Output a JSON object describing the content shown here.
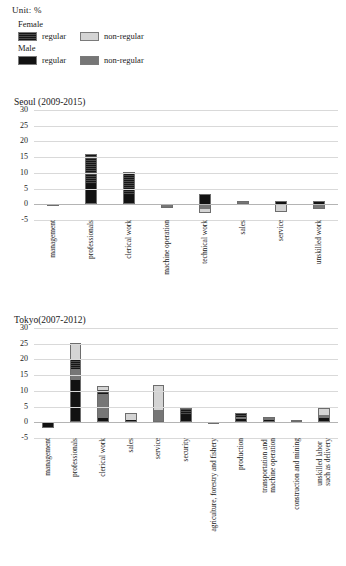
{
  "unit_note": "Unit: %",
  "legend": {
    "groups": [
      {
        "title": "Female",
        "items": [
          {
            "label": "regular",
            "swatch": "female-regular",
            "color": "#2e2e2e"
          },
          {
            "label": "non-regular",
            "swatch": "female-non-regular",
            "color": "#d4d4d4"
          }
        ]
      },
      {
        "title": "Male",
        "items": [
          {
            "label": "regular",
            "swatch": "male-regular",
            "color": "#121212"
          },
          {
            "label": "non-regular",
            "swatch": "male-non-regular",
            "color": "#767676"
          }
        ]
      }
    ]
  },
  "chart_data": [
    {
      "type": "bar",
      "stacked": true,
      "title": "Seoul (2009-2015)",
      "xlabel": "",
      "ylabel": "",
      "ylim": [
        -5,
        30
      ],
      "yticks": [
        30,
        25,
        20,
        15,
        10,
        5,
        0,
        -5
      ],
      "ytick_labels": [
        "30",
        "25",
        "20",
        "15",
        "10",
        "5",
        "0",
        "-5"
      ],
      "grid": true,
      "legend_position": "top-left",
      "categories": [
        "management",
        "professionals",
        "clerical work",
        "machine operation",
        "technical work",
        "sales",
        "service",
        "unskilled work"
      ],
      "series": [
        {
          "name": "Male regular",
          "color": "#121212",
          "values": [
            -0.5,
            6.4,
            3.0,
            0.0,
            3.4,
            0.0,
            1.2,
            0.9
          ]
        },
        {
          "name": "Male non-regular",
          "color": "#767676",
          "values": [
            0.0,
            0.0,
            0.0,
            -0.8,
            -1.6,
            0.8,
            0.0,
            -1.5
          ]
        },
        {
          "name": "Female regular",
          "color": "#2e2e2e",
          "values": [
            0.0,
            9.5,
            7.3,
            0.0,
            0.0,
            0.0,
            0.0,
            0.0
          ]
        },
        {
          "name": "Female non-regular",
          "color": "#d4d4d4",
          "values": [
            0.0,
            0.0,
            0.0,
            -0.4,
            -1.2,
            0.4,
            -2.6,
            0.0
          ]
        }
      ],
      "bar_stacks": [
        {
          "category": "management",
          "segments": [
            {
              "series": "Male regular",
              "from": -0.5,
              "to": 0.0
            }
          ]
        },
        {
          "category": "professionals",
          "segments": [
            {
              "series": "Male regular",
              "from": 0.0,
              "to": 6.4
            },
            {
              "series": "Female regular",
              "from": 6.4,
              "to": 15.9
            }
          ]
        },
        {
          "category": "clerical work",
          "segments": [
            {
              "series": "Male regular",
              "from": 0.0,
              "to": 3.0
            },
            {
              "series": "Female regular",
              "from": 3.0,
              "to": 10.3
            }
          ]
        },
        {
          "category": "machine operation",
          "segments": [
            {
              "series": "Male non-regular",
              "from": -0.8,
              "to": 0.0
            },
            {
              "series": "Female non-regular",
              "from": -1.2,
              "to": -0.8
            }
          ]
        },
        {
          "category": "technical work",
          "segments": [
            {
              "series": "Male regular",
              "from": 0.0,
              "to": 3.4
            },
            {
              "series": "Male non-regular",
              "from": -1.6,
              "to": 0.0
            },
            {
              "series": "Female non-regular",
              "from": -2.8,
              "to": -1.6
            }
          ]
        },
        {
          "category": "sales",
          "segments": [
            {
              "series": "Female non-regular",
              "from": 0.0,
              "to": 0.4
            },
            {
              "series": "Male non-regular",
              "from": 0.4,
              "to": 1.2
            }
          ]
        },
        {
          "category": "service",
          "segments": [
            {
              "series": "Male regular",
              "from": 0.0,
              "to": 1.2
            },
            {
              "series": "Female non-regular",
              "from": -2.6,
              "to": 0.0
            }
          ]
        },
        {
          "category": "unskilled work",
          "segments": [
            {
              "series": "Male regular",
              "from": 0.0,
              "to": 0.9
            },
            {
              "series": "Male non-regular",
              "from": -1.5,
              "to": 0.0
            }
          ]
        }
      ]
    },
    {
      "type": "bar",
      "stacked": true,
      "title": "Tokyo(2007-2012)",
      "xlabel": "",
      "ylabel": "",
      "ylim": [
        -5,
        30
      ],
      "yticks": [
        30,
        25,
        20,
        15,
        10,
        5,
        0,
        -5
      ],
      "ytick_labels": [
        "30",
        "25",
        "20",
        "15",
        "10",
        "5",
        "0",
        "-5"
      ],
      "grid": true,
      "legend_position": "top-left",
      "categories": [
        "management",
        "professionals",
        "clerical work",
        "sales",
        "service",
        "security",
        "agriculture, forestry and fishery",
        "production",
        "transportation and\nmachine operation",
        "construction and mining",
        "unskilled labor\nsuch as delivery"
      ],
      "series": [
        {
          "name": "Male regular",
          "color": "#121212",
          "values": [
            -1.7,
            13.3,
            1.3,
            0.6,
            0.0,
            2.3,
            -0.3,
            0.9,
            0.8,
            0.7,
            1.3
          ]
        },
        {
          "name": "Male non-regular",
          "color": "#767676",
          "values": [
            0.0,
            3.6,
            7.6,
            0.0,
            3.9,
            0.0,
            0.0,
            0.9,
            0.8,
            0.0,
            1.0
          ]
        },
        {
          "name": "Female regular",
          "color": "#2e2e2e",
          "values": [
            0.0,
            2.9,
            1.3,
            0.0,
            0.0,
            2.1,
            0.0,
            0.7,
            0.0,
            0.0,
            0.0
          ]
        },
        {
          "name": "Female non-regular",
          "color": "#d4d4d4",
          "values": [
            0.0,
            5.5,
            1.5,
            2.4,
            8.0,
            0.0,
            0.0,
            0.6,
            0.0,
            0.0,
            2.1
          ]
        }
      ],
      "bar_stacks": [
        {
          "category": "management",
          "segments": [
            {
              "series": "Male regular",
              "from": -1.7,
              "to": 0.0
            }
          ]
        },
        {
          "category": "professionals",
          "segments": [
            {
              "series": "Male regular",
              "from": 0.0,
              "to": 13.3
            },
            {
              "series": "Male non-regular",
              "from": 13.3,
              "to": 16.9
            },
            {
              "series": "Female regular",
              "from": 16.9,
              "to": 19.8
            },
            {
              "series": "Female non-regular",
              "from": 19.8,
              "to": 25.3
            }
          ]
        },
        {
          "category": "clerical work",
          "segments": [
            {
              "series": "Male regular",
              "from": 0.0,
              "to": 1.3
            },
            {
              "series": "Male non-regular",
              "from": 1.3,
              "to": 8.9
            },
            {
              "series": "Female regular",
              "from": 8.9,
              "to": 10.2
            },
            {
              "series": "Female non-regular",
              "from": 10.2,
              "to": 11.7
            }
          ]
        },
        {
          "category": "sales",
          "segments": [
            {
              "series": "Male regular",
              "from": 0.0,
              "to": 0.6
            },
            {
              "series": "Female non-regular",
              "from": 0.6,
              "to": 3.0
            }
          ]
        },
        {
          "category": "service",
          "segments": [
            {
              "series": "Male non-regular",
              "from": 0.0,
              "to": 3.9
            },
            {
              "series": "Female non-regular",
              "from": 3.9,
              "to": 11.9
            }
          ]
        },
        {
          "category": "security",
          "segments": [
            {
              "series": "Male regular",
              "from": 0.0,
              "to": 2.3
            },
            {
              "series": "Female regular",
              "from": 2.3,
              "to": 4.4
            }
          ]
        },
        {
          "category": "agriculture, forestry and fishery",
          "segments": [
            {
              "series": "Male regular",
              "from": -0.3,
              "to": 0.0
            }
          ]
        },
        {
          "category": "production",
          "segments": [
            {
              "series": "Male regular",
              "from": 0.0,
              "to": 0.9
            },
            {
              "series": "Male non-regular",
              "from": 0.9,
              "to": 1.8
            },
            {
              "series": "Female regular",
              "from": 1.8,
              "to": 2.5
            },
            {
              "series": "Female non-regular",
              "from": 2.5,
              "to": 3.1
            }
          ]
        },
        {
          "category": "transportation and\nmachine operation",
          "segments": [
            {
              "series": "Male regular",
              "from": 0.0,
              "to": 0.8
            },
            {
              "series": "Male non-regular",
              "from": 0.8,
              "to": 1.6
            }
          ]
        },
        {
          "category": "construction and mining",
          "segments": [
            {
              "series": "Male regular",
              "from": 0.0,
              "to": 0.7
            }
          ]
        },
        {
          "category": "unskilled labor\nsuch as delivery",
          "segments": [
            {
              "series": "Male regular",
              "from": 0.0,
              "to": 1.3
            },
            {
              "series": "Male non-regular",
              "from": 1.3,
              "to": 2.3
            },
            {
              "series": "Female non-regular",
              "from": 2.3,
              "to": 4.4
            }
          ]
        }
      ]
    }
  ]
}
